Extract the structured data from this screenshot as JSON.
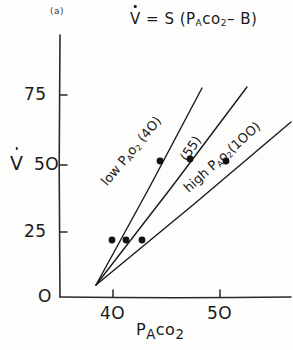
{
  "panel": {
    "label": "(a)"
  },
  "equation": {
    "lhs": "V",
    "text": "= S (P",
    "sub_a": "A",
    "mid": "co",
    "sub_2": "2",
    "tail": "– B)"
  },
  "axes": {
    "y_label": "V",
    "y_ticks": [
      {
        "value": 0,
        "label": "O",
        "py": 297
      },
      {
        "value": 25,
        "label": "25",
        "py": 232
      },
      {
        "value": 50,
        "label": "5O",
        "py": 165
      },
      {
        "value": 75,
        "label": "75",
        "py": 95
      }
    ],
    "x_label_main": "P",
    "x_label_sub_a": "A",
    "x_label_mid": "co",
    "x_label_sub_2": "2",
    "x_ticks": [
      {
        "value": 40,
        "label": "4O",
        "px": 113
      },
      {
        "value": 50,
        "label": "5O",
        "px": 220
      }
    ],
    "origin_px": 60,
    "origin_py": 297,
    "x_axis_end": 291,
    "y_axis_top": 35
  },
  "series_labels": {
    "low": {
      "pre": "low P",
      "sub_a": "A",
      "mid": "o",
      "sub_2": "2",
      "tail": " (4O)"
    },
    "mid": {
      "text": "(55)"
    },
    "high": {
      "pre": "high P",
      "sub_a": "A",
      "mid": "o",
      "sub_2": "2",
      "tail": "(1OO)"
    }
  },
  "chart_data": {
    "type": "line",
    "subtitle": "(a)",
    "xlabel": "P_A co2",
    "ylabel": "V (dot)",
    "xlim": [
      36.5,
      57.5
    ],
    "ylim": [
      0,
      88
    ],
    "x_ticks": [
      40,
      50
    ],
    "y_ticks": [
      0,
      25,
      50,
      75
    ],
    "grid": false,
    "legend": "inline-rotated-labels",
    "annotations": [
      {
        "text": "V = S (P_A co2 - B)",
        "x_px": 130,
        "y_px": 10
      },
      {
        "text": "(a)",
        "x_px": 50,
        "y_px": 6
      }
    ],
    "common_intercept": {
      "x": 43.5,
      "y": 4,
      "x_px": 96,
      "y_px": 285
    },
    "series": [
      {
        "name": "low P_A o2 (40)",
        "po2": 40,
        "slope": 3.2,
        "line_px": {
          "x1": 96,
          "y1": 285,
          "x2": 202,
          "y2": 88
        },
        "points": [
          {
            "x": 38.9,
            "y": 22,
            "x_px": 112,
            "y_px": 240
          },
          {
            "x": 41.1,
            "y": 52,
            "x_px": 160,
            "y_px": 161
          }
        ]
      },
      {
        "name": "(55)",
        "po2": 55,
        "slope": 2.2,
        "line_px": {
          "x1": 96,
          "y1": 285,
          "x2": 247,
          "y2": 87
        },
        "points": [
          {
            "x": 39.6,
            "y": 22,
            "x_px": 126,
            "y_px": 240
          },
          {
            "x": 42.5,
            "y": 53,
            "x_px": 190,
            "y_px": 159
          }
        ]
      },
      {
        "name": "high P_A o2 (100)",
        "po2": 100,
        "slope": 1.45,
        "line_px": {
          "x1": 96,
          "y1": 285,
          "x2": 291,
          "y2": 122
        },
        "points": [
          {
            "x": 40.3,
            "y": 22,
            "x_px": 142,
            "y_px": 240
          },
          {
            "x": 44.2,
            "y": 52,
            "x_px": 226,
            "y_px": 161
          }
        ]
      }
    ]
  }
}
